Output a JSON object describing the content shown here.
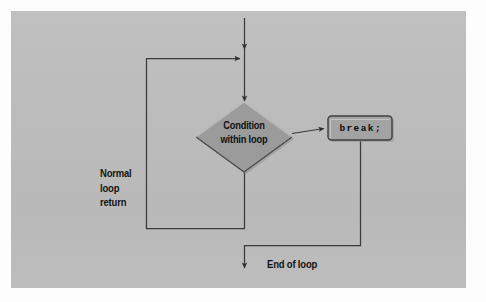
{
  "figure": {
    "type": "flowchart"
  },
  "canvas": {
    "width": 486,
    "height": 302,
    "background_color": "#fdfdfd",
    "panel_color": "#bcbcbc"
  },
  "colors": {
    "panel": "#bcbcbc",
    "shape_fill": "#9b9b9b",
    "shape_fill_light": "#a7a7a7",
    "shape_edge_dark": "#4a4a4a",
    "shape_edge_light": "#c9c9c9",
    "line": "#3c3c3c",
    "text": "#121212",
    "shadow": "#8e8e8e"
  },
  "nodes": {
    "decision": {
      "label_line1": "Condition",
      "label_line2": "within loop",
      "shape": "diamond",
      "center_x": 244,
      "center_y": 137,
      "half_width": 48,
      "half_height": 35
    },
    "break_statement": {
      "label": "break;",
      "shape": "rounded-rect",
      "x": 328,
      "y": 116,
      "width": 64,
      "height": 24
    }
  },
  "labels": {
    "normal_loop_return": "Normal\nloop\nreturn",
    "end_of_loop": "End of loop"
  },
  "edges": [
    {
      "name": "entry-arrow",
      "from": "top-of-figure",
      "to": "decision",
      "has_arrowhead": true
    },
    {
      "name": "loop-back-arrow",
      "from": "loop-bottom",
      "to": "entry-junction",
      "label": "Normal loop return",
      "has_arrowhead": true
    },
    {
      "name": "break-branch",
      "from": "decision",
      "to": "break_statement",
      "has_arrowhead": true
    },
    {
      "name": "exit-arrow",
      "from": "break_statement",
      "to": "end-of-loop",
      "label": "End of loop",
      "has_arrowhead": true
    }
  ]
}
